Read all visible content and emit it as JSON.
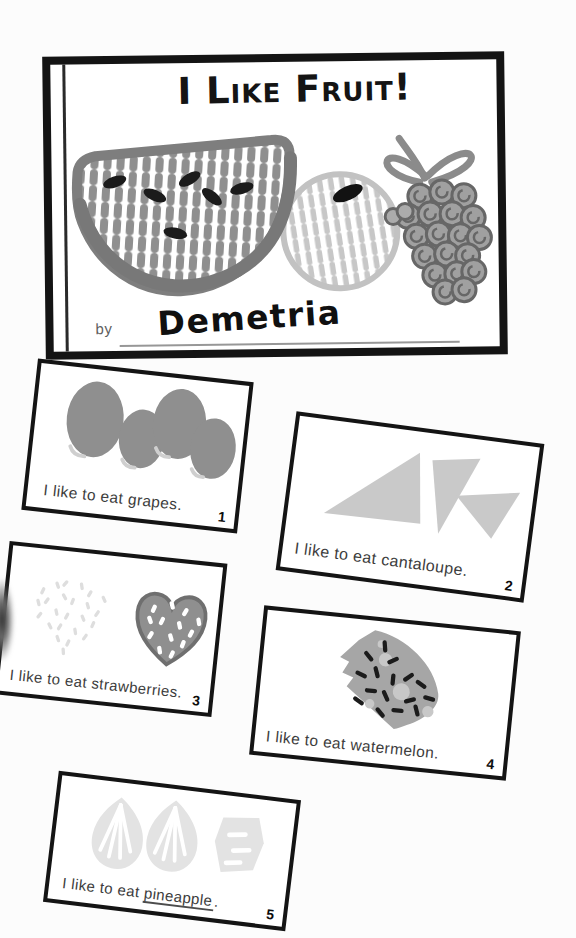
{
  "cover": {
    "title": "I Like Fruit!",
    "by_label": "by",
    "author": "Demetria"
  },
  "pages": [
    {
      "caption": "I like to eat grapes.",
      "number": "1",
      "fruit": "grapes"
    },
    {
      "caption": "I like to eat cantaloupe.",
      "number": "2",
      "fruit": "cantaloupe"
    },
    {
      "caption": "I like to eat strawberries.",
      "number": "3",
      "fruit": "strawberries"
    },
    {
      "caption": "I like to eat watermelon.",
      "number": "4",
      "fruit": "watermelon"
    },
    {
      "caption_prefix": "I like to eat ",
      "underlined_word": "pineapple",
      "caption_suffix": ".",
      "number": "5",
      "fruit": "pineapple"
    }
  ],
  "colors": {
    "ink": "#141414",
    "paper": "#fcfcfc",
    "illustration_gray": "#8f8f8f",
    "light_gray": "#c9c9c9",
    "faint_gray": "#e3e3e3"
  }
}
